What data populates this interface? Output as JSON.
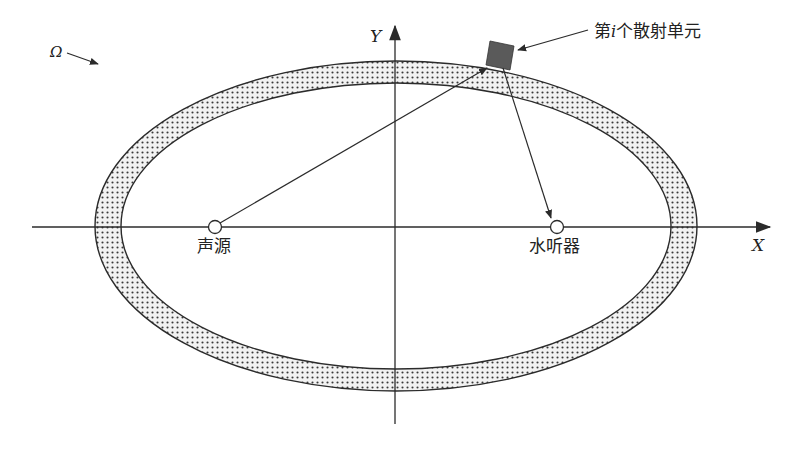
{
  "diagram": {
    "type": "scattering-geometry",
    "axes": {
      "x_label": "X",
      "y_label": "Y"
    },
    "region_label": "Ω",
    "source": {
      "label": "声源"
    },
    "receiver": {
      "label": "水听器"
    },
    "scatter_element": {
      "label_prefix": "第",
      "label_var": "i",
      "label_suffix": "个散射单元"
    },
    "colors": {
      "line": "#2b2b2b",
      "band_fill": "#e6e6e6",
      "dots": "#3a3a3a",
      "element_fill": "#5a5a5a",
      "background": "#ffffff"
    }
  }
}
